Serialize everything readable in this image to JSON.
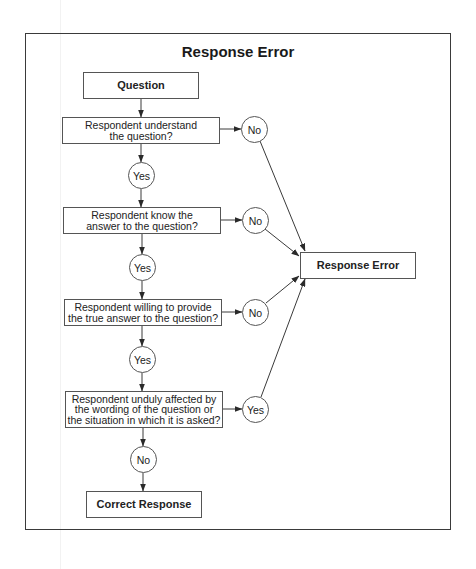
{
  "title": "Response Error",
  "nodes": {
    "question": "Question",
    "decision1": "Respondent understand\nthe question?",
    "decision2": "Respondent know the\nanswer to the question?",
    "decision3": "Respondent willing to provide\nthe true answer to the question?",
    "decision4": "Respondent unduly affected by\nthe wording of the question or\nthe situation in which it is asked?",
    "response_error": "Response Error",
    "correct_response": "Correct Response"
  },
  "branches": {
    "d1_no": "No",
    "d1_yes": "Yes",
    "d2_no": "No",
    "d2_yes": "Yes",
    "d3_no": "No",
    "d3_yes": "Yes",
    "d4_yes": "Yes",
    "d4_no": "No"
  },
  "colors": {
    "line": "#3a3a3a",
    "frame": "#3a3a3a"
  }
}
